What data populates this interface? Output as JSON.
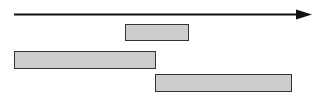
{
  "canvas": {
    "width": 324,
    "height": 101,
    "background_color": "#ffffff"
  },
  "axis": {
    "name": "time-axis",
    "orientation": "horizontal",
    "x_start": 14,
    "x_end": 296,
    "arrow_tip_x": 312,
    "y": 14.5,
    "stroke_color": "#111111",
    "stroke_width": 2,
    "arrowhead": "filled-triangle",
    "label": ""
  },
  "chart_data": {
    "type": "bar",
    "title": "",
    "xlabel": "",
    "ylabel": "",
    "orientation": "horizontal",
    "grid": false,
    "legend": false,
    "categories": [
      "interval-1",
      "interval-2",
      "interval-3"
    ],
    "series": [
      {
        "name": "intervals",
        "values": [
          64,
          142,
          137
        ]
      }
    ],
    "bars": [
      {
        "name": "interval-1",
        "label": "",
        "x": 125,
        "y": 24,
        "width": 64,
        "height": 17,
        "start": 125,
        "end": 189,
        "fill_color": "#cdcdcd",
        "border_color": "#333333"
      },
      {
        "name": "interval-2",
        "label": "",
        "x": 14,
        "y": 51,
        "width": 142,
        "height": 18,
        "start": 14,
        "end": 156,
        "fill_color": "#cdcdcd",
        "border_color": "#333333"
      },
      {
        "name": "interval-3",
        "label": "",
        "x": 155,
        "y": 74,
        "width": 137,
        "height": 18,
        "start": 155,
        "end": 292,
        "fill_color": "#cdcdcd",
        "border_color": "#333333"
      }
    ],
    "xlim": [
      14,
      312
    ],
    "ylim": [
      0,
      101
    ]
  },
  "colors": {
    "bar_fill": "#cdcdcd",
    "bar_border": "#333333",
    "axis_stroke": "#111111",
    "background": "#ffffff"
  }
}
